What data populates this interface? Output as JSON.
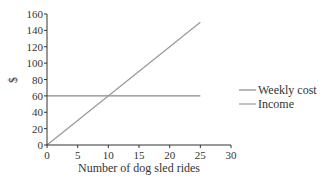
{
  "chart_data": {
    "type": "line",
    "title": "",
    "xlabel": "Number of dog sled rides",
    "ylabel": "$",
    "xlim": [
      0,
      30
    ],
    "ylim": [
      0,
      160
    ],
    "x_ticks": [
      0,
      5,
      10,
      15,
      20,
      25,
      30
    ],
    "y_ticks": [
      0,
      20,
      40,
      60,
      80,
      100,
      120,
      140,
      160
    ],
    "grid": false,
    "legend_position": "right",
    "series": [
      {
        "name": "Weekly cost",
        "x": [
          0,
          25
        ],
        "y": [
          60,
          60
        ],
        "color": "#888888"
      },
      {
        "name": "Income",
        "x": [
          0,
          25
        ],
        "y": [
          0,
          150
        ],
        "color": "#999999"
      }
    ]
  },
  "legend": {
    "items": [
      {
        "label": "Weekly cost"
      },
      {
        "label": "Income"
      }
    ]
  }
}
